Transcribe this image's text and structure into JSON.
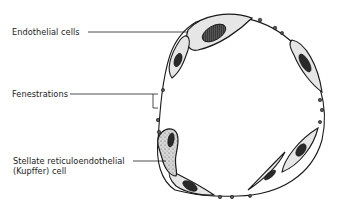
{
  "diagram": {
    "labels": {
      "endothelial_cells": "Endothelial cells",
      "fenestrations": "Fenestrations",
      "kupffer_line1": "Stellate reticuloendothelial",
      "kupffer_line2": "(Kupffer) cell"
    },
    "colors": {
      "outline": "#1a1a1a",
      "cell_fill": "#e6e6e6",
      "nucleus_fill": "#2a2a2a",
      "background": "#ffffff"
    }
  }
}
